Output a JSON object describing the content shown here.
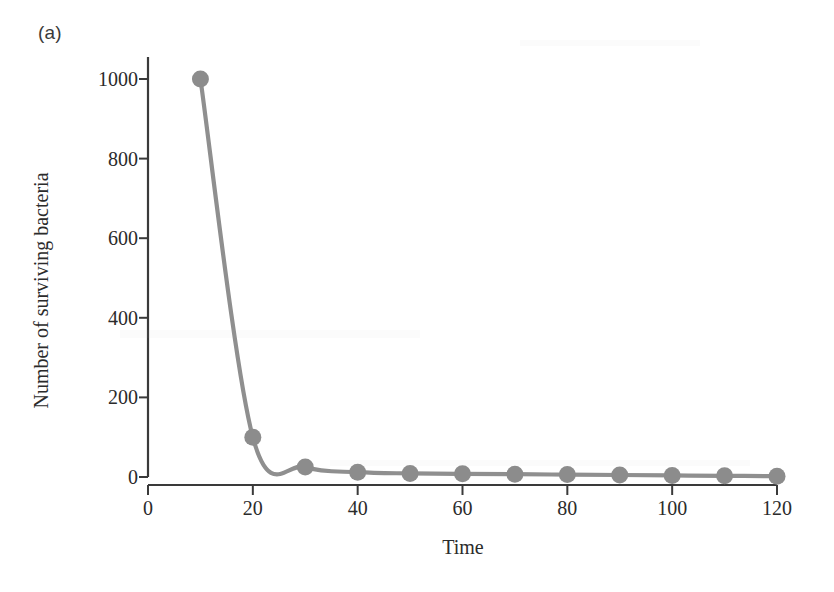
{
  "figure": {
    "panel_label": "(a)",
    "xlabel": "Time",
    "ylabel": "Number of surviving bacteria",
    "line_color": "#8f8f8f",
    "marker_color": "#8c8c8c",
    "axis_color": "#3a3a3a",
    "background_color": "#ffffff"
  },
  "chart_data": {
    "type": "line",
    "title": "",
    "subtitle": "",
    "xlabel": "Time",
    "ylabel": "Number of surviving bacteria",
    "xlim": [
      0,
      120
    ],
    "ylim": [
      0,
      1000
    ],
    "xticks": [
      0,
      20,
      40,
      60,
      80,
      100,
      120
    ],
    "yticks": [
      0,
      200,
      400,
      600,
      800,
      1000
    ],
    "xticklabels": [
      "0",
      "20",
      "40",
      "60",
      "80",
      "100",
      "120"
    ],
    "yticklabels": [
      "0",
      "200",
      "400",
      "600",
      "800",
      "1000"
    ],
    "grid": false,
    "legend": false,
    "marker": "circle",
    "series": [
      {
        "name": "Surviving bacteria",
        "x": [
          10,
          20,
          30,
          40,
          50,
          60,
          70,
          80,
          90,
          100,
          110,
          120
        ],
        "values": [
          1000,
          100,
          25,
          12,
          9,
          8,
          7,
          6,
          5,
          4,
          3,
          2
        ]
      }
    ]
  }
}
